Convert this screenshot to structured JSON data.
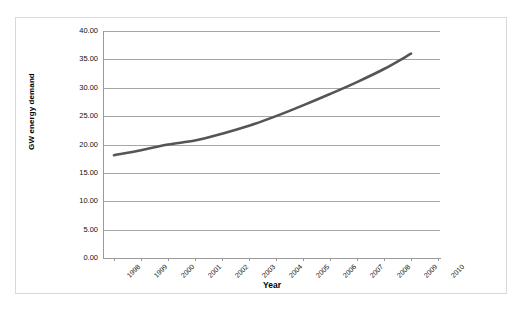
{
  "chart_data": {
    "type": "line",
    "title": "",
    "xlabel": "Year",
    "ylabel": "GW energy demand",
    "x": [
      1998,
      1999,
      2000,
      2001,
      2002,
      2003,
      2004,
      2005,
      2006,
      2007,
      2008,
      2009,
      2010
    ],
    "categories": [
      "1998",
      "1999",
      "2000",
      "2001",
      "2002",
      "2003",
      "2004",
      "2005",
      "2006",
      "2007",
      "2008",
      "2009",
      "2010"
    ],
    "series": [
      {
        "name": "GW energy demand",
        "color": "#555555",
        "x": [
          1998,
          1999,
          2000,
          2001,
          2002,
          2003,
          2004,
          2005,
          2006,
          2007,
          2008,
          2009
        ],
        "values": [
          18.1,
          19.0,
          20.0,
          20.7,
          21.9,
          23.3,
          25.0,
          26.9,
          28.9,
          31.0,
          33.3,
          36.0
        ]
      }
    ],
    "ylim": [
      0,
      40
    ],
    "ytick_step": 5,
    "ytick_labels": [
      "0.00",
      "5.00",
      "10.00",
      "15.00",
      "20.00",
      "25.00",
      "30.00",
      "35.00",
      "40.00"
    ],
    "ytick_values": [
      0,
      5,
      10,
      15,
      20,
      25,
      30,
      35,
      40
    ],
    "grid": true,
    "grid_axis": "y",
    "legend": false,
    "legend_position": "none",
    "xtick_rotation": -45,
    "background": "#ffffff",
    "grid_color": "#a6a6a6",
    "axis_color": "#9a9a9a",
    "frame_color": "#d9d9d9"
  }
}
